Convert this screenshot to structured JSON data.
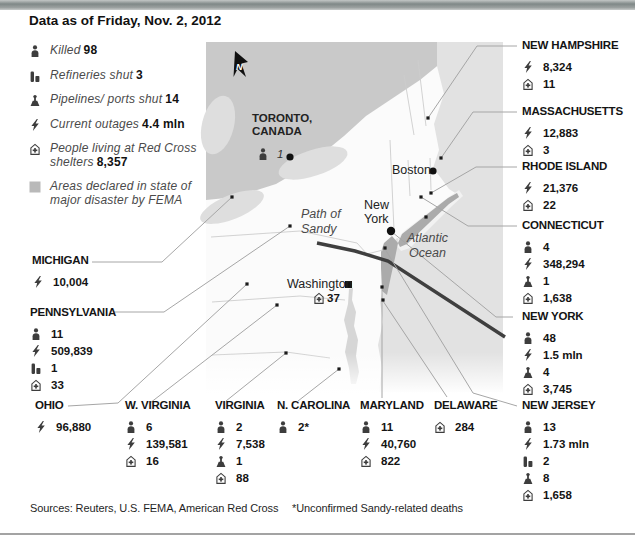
{
  "title": "Data as of Friday, Nov. 2, 2012",
  "colors": {
    "canada": "#c9c9c9",
    "lake": "#dedede",
    "ocean": "#e2e2e2",
    "fema_area": "#ababab",
    "chesapeake": "#d6d6d6",
    "sandy_path": "#3f3f3f",
    "connector_line": "#a6a6a6",
    "icon": "#3d3d3d"
  },
  "legend": {
    "items": [
      {
        "icon": "killed-icon",
        "label": "Killed",
        "value": "98"
      },
      {
        "icon": "refinery-icon",
        "label": "Refineries shut",
        "value": "3"
      },
      {
        "icon": "port-icon",
        "label": "Pipelines/ ports shut",
        "value": "14"
      },
      {
        "icon": "outage-icon",
        "label": "Current outages",
        "value": "4.4 mln"
      },
      {
        "icon": "shelter-icon",
        "label": "People living at Red Cross shelters",
        "value": "8,357"
      },
      {
        "icon": "fema-square-icon",
        "label": "Areas declared in state of major disaster by FEMA",
        "value": ""
      }
    ]
  },
  "map": {
    "north_indicator": "N",
    "toronto": {
      "label": "TORONTO,\nCANADA",
      "killed": "1"
    },
    "boston": {
      "label": "Boston"
    },
    "new_york": {
      "label": "New\nYork"
    },
    "washington": {
      "label": "Washington",
      "shelters": "37"
    },
    "annotations": {
      "path_of_sandy": "Path of\nSandy",
      "atlantic_ocean": "Atlantic\nOcean"
    }
  },
  "states": [
    {
      "id": "new-hampshire",
      "name": "NEW HAMPSHIRE",
      "stats": [
        {
          "icon": "outage-icon",
          "value": "8,324"
        },
        {
          "icon": "shelter-icon",
          "value": "11"
        }
      ]
    },
    {
      "id": "massachusetts",
      "name": "MASSACHUSETTS",
      "stats": [
        {
          "icon": "outage-icon",
          "value": "12,883"
        },
        {
          "icon": "shelter-icon",
          "value": "3"
        }
      ]
    },
    {
      "id": "rhode-island",
      "name": "RHODE ISLAND",
      "stats": [
        {
          "icon": "outage-icon",
          "value": "21,376"
        },
        {
          "icon": "shelter-icon",
          "value": "22"
        }
      ]
    },
    {
      "id": "connecticut",
      "name": "CONNECTICUT",
      "stats": [
        {
          "icon": "killed-icon",
          "value": "4"
        },
        {
          "icon": "outage-icon",
          "value": "348,294"
        },
        {
          "icon": "port-icon",
          "value": "1"
        },
        {
          "icon": "shelter-icon",
          "value": "1,638"
        }
      ]
    },
    {
      "id": "new-york",
      "name": "NEW YORK",
      "stats": [
        {
          "icon": "killed-icon",
          "value": "48"
        },
        {
          "icon": "outage-icon",
          "value": "1.5 mln"
        },
        {
          "icon": "port-icon",
          "value": "4"
        },
        {
          "icon": "shelter-icon",
          "value": "3,745"
        }
      ]
    },
    {
      "id": "new-jersey",
      "name": "NEW JERSEY",
      "stats": [
        {
          "icon": "killed-icon",
          "value": "13"
        },
        {
          "icon": "outage-icon",
          "value": "1.73 mln"
        },
        {
          "icon": "refinery-icon",
          "value": "2"
        },
        {
          "icon": "port-icon",
          "value": "8"
        },
        {
          "icon": "shelter-icon",
          "value": "1,658"
        }
      ]
    },
    {
      "id": "delaware",
      "name": "DELAWARE",
      "stats": [
        {
          "icon": "shelter-icon",
          "value": "284"
        }
      ]
    },
    {
      "id": "maryland",
      "name": "MARYLAND",
      "stats": [
        {
          "icon": "killed-icon",
          "value": "11"
        },
        {
          "icon": "outage-icon",
          "value": "40,760"
        },
        {
          "icon": "shelter-icon",
          "value": "822"
        }
      ]
    },
    {
      "id": "n-carolina",
      "name": "N. CAROLINA",
      "stats": [
        {
          "icon": "killed-icon",
          "value": "2*"
        }
      ]
    },
    {
      "id": "virginia",
      "name": "VIRGINIA",
      "stats": [
        {
          "icon": "killed-icon",
          "value": "2"
        },
        {
          "icon": "outage-icon",
          "value": "7,538"
        },
        {
          "icon": "port-icon",
          "value": "1"
        },
        {
          "icon": "shelter-icon",
          "value": "88"
        }
      ]
    },
    {
      "id": "w-virginia",
      "name": "W. VIRGINIA",
      "stats": [
        {
          "icon": "killed-icon",
          "value": "6"
        },
        {
          "icon": "outage-icon",
          "value": "139,581"
        },
        {
          "icon": "shelter-icon",
          "value": "16"
        }
      ]
    },
    {
      "id": "ohio",
      "name": "OHIO",
      "stats": [
        {
          "icon": "outage-icon",
          "value": "96,880"
        }
      ]
    },
    {
      "id": "michigan",
      "name": "MICHIGAN",
      "stats": [
        {
          "icon": "outage-icon",
          "value": "10,004"
        }
      ]
    },
    {
      "id": "pennsylvania",
      "name": "PENNSYLVANIA",
      "stats": [
        {
          "icon": "killed-icon",
          "value": "11"
        },
        {
          "icon": "outage-icon",
          "value": "509,839"
        },
        {
          "icon": "refinery-icon",
          "value": "1"
        },
        {
          "icon": "shelter-icon",
          "value": "33"
        }
      ]
    }
  ],
  "footer": {
    "sources": "Sources: Reuters, U.S. FEMA, American Red Cross",
    "note": "*Unconfirmed Sandy-related deaths"
  }
}
